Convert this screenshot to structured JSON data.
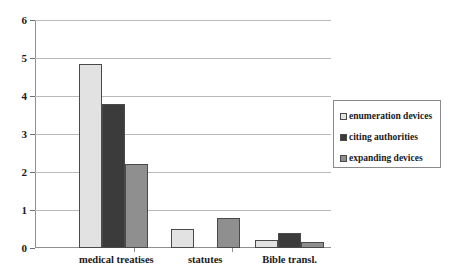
{
  "chart_data": {
    "type": "bar",
    "title": "",
    "subtitle": "",
    "xlabel": "",
    "ylabel": "",
    "categories": [
      "medical treatises",
      "statutes",
      "Bible transl."
    ],
    "series": [
      {
        "name": "enumeration devices",
        "color": "#e2e2e2",
        "values": [
          4.85,
          0.5,
          0.2
        ]
      },
      {
        "name": "citing authorities",
        "color": "#3b3b3b",
        "values": [
          3.8,
          0,
          0.4
        ]
      },
      {
        "name": "expanding devices",
        "color": "#8f8f8f",
        "values": [
          2.2,
          0.8,
          0.15
        ]
      }
    ],
    "ylim": [
      0,
      6
    ],
    "ytick_labels": [
      "0",
      "1",
      "2",
      "3",
      "4",
      "5",
      "6"
    ],
    "ytick_values": [
      0,
      1,
      2,
      3,
      4,
      5,
      6
    ],
    "grid": true,
    "grid_axis": "y",
    "legend_position": "right",
    "legend_entries": [
      "enumeration devices",
      "citing authorities",
      "expanding devices"
    ]
  },
  "axis": {
    "y_labels": [
      {
        "text": "6",
        "value": 6
      },
      {
        "text": "5",
        "value": 5
      },
      {
        "text": "4",
        "value": 4
      },
      {
        "text": "3",
        "value": 3
      },
      {
        "text": "2",
        "value": 2
      },
      {
        "text": "1",
        "value": 1
      },
      {
        "text": "0",
        "value": 0
      }
    ],
    "x_labels": [
      "medical treatises",
      "statutes",
      "Bible transl."
    ]
  },
  "legend": {
    "items": [
      {
        "label": "enumeration devices",
        "swatch": "#e2e2e2"
      },
      {
        "label": "citing authorities",
        "swatch": "#3b3b3b"
      },
      {
        "label": "expanding devices",
        "swatch": "#8f8f8f"
      }
    ]
  },
  "colors": {
    "series_1": "#e2e2e2",
    "series_2": "#3b3b3b",
    "series_3": "#8f8f8f",
    "gridline": "#b9b9b9",
    "axis": "#8f8f8f",
    "bar_outline": "#4a4a4a",
    "text": "#1a1a1a",
    "background": "#ffffff"
  }
}
